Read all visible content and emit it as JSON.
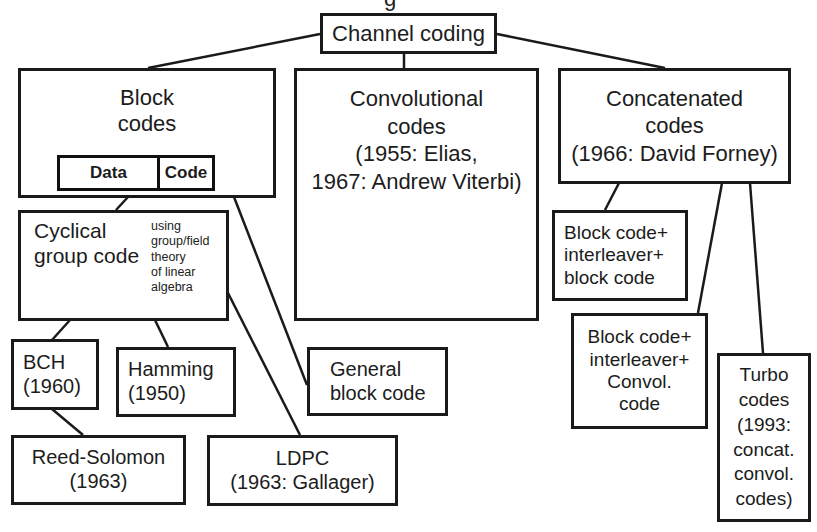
{
  "title_partial": "g",
  "root": {
    "label": "Channel coding"
  },
  "block_codes": {
    "label_lines": [
      "Block",
      "codes"
    ],
    "strip": {
      "data_label": "Data",
      "code_label": "Code"
    }
  },
  "convolutional_codes": {
    "label_lines": [
      "Convolutional",
      "codes",
      "(1955: Elias,",
      "1967: Andrew Viterbi)"
    ],
    "encoder_diagram": {
      "input_label": "in",
      "output1_label": "out1",
      "output2_label": "out2",
      "adder_symbol": "+"
    }
  },
  "concatenated_codes": {
    "label_lines": [
      "Concatenated",
      "codes",
      "(1966: David Forney)"
    ]
  },
  "cyclical_group_code": {
    "label_lines": [
      "Cyclical",
      "group code"
    ],
    "note_lines": [
      "using",
      "group/field",
      "theory",
      "of linear",
      "algebra"
    ]
  },
  "bch": {
    "label_lines": [
      "BCH",
      "(1960)"
    ]
  },
  "hamming": {
    "label_lines": [
      "Hamming",
      "(1950)"
    ]
  },
  "general_block_code": {
    "label_lines": [
      "General",
      "block code"
    ]
  },
  "reed_solomon": {
    "label_lines": [
      "Reed-Solomon",
      "(1963)"
    ]
  },
  "ldpc": {
    "label_lines": [
      "LDPC",
      "(1963: Gallager)"
    ]
  },
  "block_interleaver_block": {
    "label_lines": [
      "Block code+",
      "interleaver+",
      "block code"
    ]
  },
  "block_interleaver_convol": {
    "label_lines": [
      "Block code+",
      "interleaver+",
      "Convol.",
      "code"
    ]
  },
  "turbo_codes": {
    "label_lines": [
      "Turbo",
      "codes",
      "(1993:",
      "concat.",
      "convol.",
      "codes)"
    ]
  },
  "colors": {
    "line": "#1a1a1a",
    "background": "#ffffff",
    "text": "#1c1c1c"
  }
}
